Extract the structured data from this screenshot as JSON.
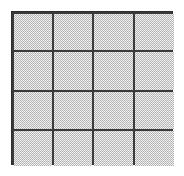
{
  "figure": {
    "type": "grid-diagram",
    "background_color": "#ffffff",
    "line_color": "#3a3a3a",
    "border_color": "#2e2e2e",
    "cell_fill_color": "#b9b9b9",
    "cell_texture": "dither-checkerboard",
    "rows": 4,
    "columns": 4,
    "cell_count": 16,
    "position": {
      "x": 11,
      "y": 11,
      "width": 162,
      "height": 154
    },
    "line_thickness_px": 2,
    "column_boundaries_px": [
      11,
      51,
      91,
      132,
      173
    ],
    "row_boundaries_px": [
      11,
      49,
      89,
      128,
      165
    ],
    "cells": [
      {
        "id": "r1c1",
        "row": 1,
        "column": 1,
        "label": ""
      },
      {
        "id": "r1c2",
        "row": 1,
        "column": 2,
        "label": ""
      },
      {
        "id": "r1c3",
        "row": 1,
        "column": 3,
        "label": ""
      },
      {
        "id": "r1c4",
        "row": 1,
        "column": 4,
        "label": ""
      },
      {
        "id": "r2c1",
        "row": 2,
        "column": 1,
        "label": ""
      },
      {
        "id": "r2c2",
        "row": 2,
        "column": 2,
        "label": ""
      },
      {
        "id": "r2c3",
        "row": 2,
        "column": 3,
        "label": ""
      },
      {
        "id": "r2c4",
        "row": 2,
        "column": 4,
        "label": ""
      },
      {
        "id": "r3c1",
        "row": 3,
        "column": 1,
        "label": ""
      },
      {
        "id": "r3c2",
        "row": 3,
        "column": 2,
        "label": ""
      },
      {
        "id": "r3c3",
        "row": 3,
        "column": 3,
        "label": ""
      },
      {
        "id": "r3c4",
        "row": 3,
        "column": 4,
        "label": ""
      },
      {
        "id": "r4c1",
        "row": 4,
        "column": 1,
        "label": ""
      },
      {
        "id": "r4c2",
        "row": 4,
        "column": 2,
        "label": ""
      },
      {
        "id": "r4c3",
        "row": 4,
        "column": 3,
        "label": ""
      },
      {
        "id": "r4c4",
        "row": 4,
        "column": 4,
        "label": ""
      }
    ]
  }
}
